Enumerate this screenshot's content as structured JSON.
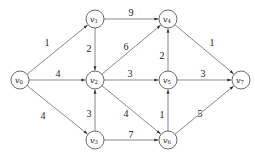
{
  "diagram": {
    "type": "weighted directed graph",
    "nodes": [
      {
        "id": "v0",
        "base": "v",
        "sub": "0",
        "x": 20,
        "y": 80
      },
      {
        "id": "v1",
        "base": "v",
        "sub": "1",
        "x": 95,
        "y": 19
      },
      {
        "id": "v2",
        "base": "v",
        "sub": "2",
        "x": 95,
        "y": 80
      },
      {
        "id": "v3",
        "base": "v",
        "sub": "3",
        "x": 95,
        "y": 140
      },
      {
        "id": "v4",
        "base": "v",
        "sub": "4",
        "x": 168,
        "y": 19
      },
      {
        "id": "v5",
        "base": "v",
        "sub": "5",
        "x": 168,
        "y": 80
      },
      {
        "id": "v6",
        "base": "v",
        "sub": "6",
        "x": 168,
        "y": 140
      },
      {
        "id": "v7",
        "base": "v",
        "sub": "7",
        "x": 241,
        "y": 80
      }
    ],
    "edges": [
      {
        "from": "v0",
        "to": "v1",
        "weight": "1",
        "lx": 47,
        "ly": 44
      },
      {
        "from": "v0",
        "to": "v2",
        "weight": "4",
        "lx": 58,
        "ly": 75
      },
      {
        "from": "v0",
        "to": "v3",
        "weight": "4",
        "lx": 43,
        "ly": 117
      },
      {
        "from": "v1",
        "to": "v4",
        "weight": "9",
        "lx": 131,
        "ly": 14
      },
      {
        "from": "v1",
        "to": "v2",
        "weight": "2",
        "lx": 89,
        "ly": 50
      },
      {
        "from": "v2",
        "to": "v4",
        "weight": "6",
        "lx": 126,
        "ly": 48
      },
      {
        "from": "v2",
        "to": "v5",
        "weight": "3",
        "lx": 130,
        "ly": 75
      },
      {
        "from": "v2",
        "to": "v6",
        "weight": "4",
        "lx": 126,
        "ly": 115
      },
      {
        "from": "v3",
        "to": "v2",
        "weight": "3",
        "lx": 89,
        "ly": 115
      },
      {
        "from": "v3",
        "to": "v6",
        "weight": "7",
        "lx": 131,
        "ly": 136
      },
      {
        "from": "v5",
        "to": "v4",
        "weight": "2",
        "lx": 162,
        "ly": 57
      },
      {
        "from": "v5",
        "to": "v7",
        "weight": "3",
        "lx": 203,
        "ly": 75
      },
      {
        "from": "v4",
        "to": "v7",
        "weight": "1",
        "lx": 212,
        "ly": 44
      },
      {
        "from": "v6",
        "to": "v5",
        "weight": "1",
        "lx": 162,
        "ly": 116
      },
      {
        "from": "v6",
        "to": "v7",
        "weight": "5",
        "lx": 200,
        "ly": 115
      }
    ]
  }
}
